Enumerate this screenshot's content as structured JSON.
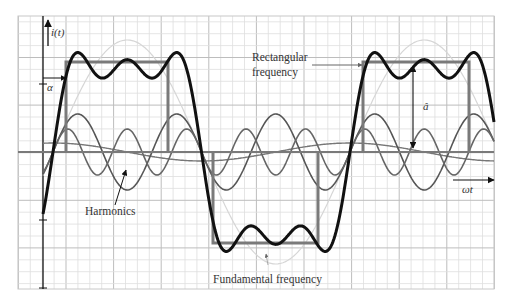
{
  "chart_data": {
    "type": "line",
    "title": "",
    "xlabel": "ωt",
    "ylabel": "i(t)",
    "grid": true,
    "plot_area": {
      "x0": 18,
      "y0": 16,
      "x1": 494,
      "y1": 289
    },
    "axes": {
      "y_axis_x": 43,
      "x_axis_y": 152,
      "y_ticks_px": [
        84,
        220
      ]
    },
    "grid_spec": {
      "minor_px": 11.9,
      "major_every": 4,
      "major_origin_x": 66,
      "major_origin_y": 57.5
    },
    "waveform": {
      "zero_crossing_x": 53,
      "period_px": 297,
      "amplitude_px": 90
    },
    "series": [
      {
        "name": "Resulting waveform (sum of harmonics 1,3,5)",
        "harmonics": [
          1,
          3,
          5
        ],
        "color": "#111111",
        "width": 3
      },
      {
        "name": "Rectangular frequency",
        "shape": "pulse-train",
        "pulses": [
          {
            "x0": 66,
            "x1": 168,
            "level": "high",
            "y": 62
          },
          {
            "x0": 213,
            "x1": 318,
            "level": "low",
            "y": 243
          },
          {
            "x0": 363,
            "x1": 469,
            "level": "high",
            "y": 62
          }
        ],
        "color": "#7a7a7a",
        "width": 3
      },
      {
        "name": "Fundamental frequency",
        "harmonic": 1,
        "amplitude_px": 112,
        "color": "#d6d6d6",
        "width": 1.2
      },
      {
        "name": "Harmonic 3",
        "harmonic": 3,
        "amplitude_px": 38,
        "color": "#555555",
        "width": 1.6
      },
      {
        "name": "Harmonic 5",
        "harmonic": 5,
        "amplitude_px": 23,
        "color": "#666666",
        "width": 1.6
      },
      {
        "name": "Harmonic low",
        "harmonic": 1,
        "amplitude_px": 9,
        "phase_shift": 1.57,
        "color": "#777777",
        "width": 1.4
      }
    ],
    "annotations": [
      {
        "text": "i(t)",
        "x": 50,
        "y": 36,
        "italic": true
      },
      {
        "text": "α",
        "x": 48,
        "y": 89,
        "italic": true
      },
      {
        "text": "Rectangular",
        "x": 252,
        "y": 61
      },
      {
        "text": "frequency",
        "x": 252,
        "y": 76
      },
      {
        "text": "â",
        "x": 423,
        "y": 110,
        "italic": true
      },
      {
        "text": "Harmonics",
        "x": 85,
        "y": 215
      },
      {
        "text": "Fundamental frequency",
        "x": 213,
        "y": 283
      },
      {
        "text": "ωt",
        "x": 461,
        "y": 193,
        "italic": true
      }
    ]
  },
  "labels": {
    "y_axis": "i(t)",
    "alpha": "α",
    "rect_line1": "Rectangular",
    "rect_line2": "frequency",
    "amp": "â",
    "harmonics": "Harmonics",
    "fundamental": "Fundamental frequency",
    "x_axis": "ωt"
  }
}
